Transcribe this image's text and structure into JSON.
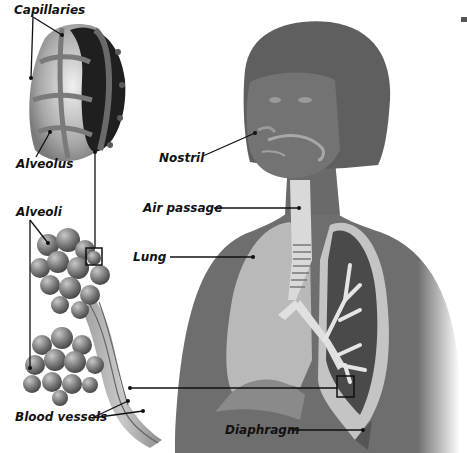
{
  "diagram": {
    "labels": {
      "capillaries": "Capillaries",
      "alveolus": "Alveolus",
      "alveoli": "Alveoli",
      "blood_vessels": "Blood vessels",
      "nostril": "Nostril",
      "air_passage": "Air passage",
      "lung": "Lung",
      "diaphragm": "Diaphragm"
    },
    "colors": {
      "background": "#ffffff",
      "body": "#6e6e6e",
      "hair": "#5f5f5f",
      "lung_light": "#b9b9b9",
      "lung_cut": "#4a4a4a",
      "trachea": "#d8d8d8",
      "alveoli": "#8a8a8a",
      "line": "#111111"
    }
  }
}
